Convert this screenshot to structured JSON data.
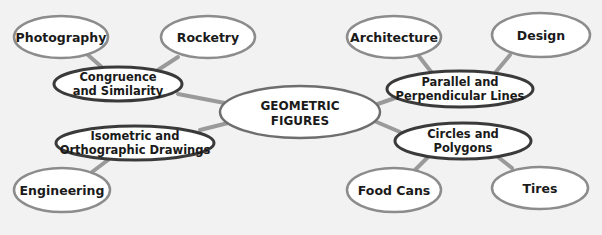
{
  "diagram": {
    "type": "concept-map",
    "colors": {
      "background": "#f2f2f2",
      "node_fill": "#ffffff",
      "leaf_stroke": "#8c8c8c",
      "mid_stroke": "#3a3a3a",
      "center_stroke": "#6e6e6e",
      "connector": "#9a9a9a",
      "text": "#1a1a1a"
    },
    "center": {
      "id": "geometric-figures",
      "lines": [
        "GEOMETRIC",
        "FIGURES"
      ]
    },
    "branches": [
      {
        "id": "congruence-similarity",
        "lines": [
          "Congruence",
          "and Similarity"
        ],
        "children": [
          {
            "id": "photography",
            "lines": [
              "Photography"
            ]
          },
          {
            "id": "rocketry",
            "lines": [
              "Rocketry"
            ]
          }
        ]
      },
      {
        "id": "isometric-orthographic",
        "lines": [
          "Isometric and",
          "Orthographic Drawings"
        ],
        "children": [
          {
            "id": "engineering",
            "lines": [
              "Engineering"
            ]
          }
        ]
      },
      {
        "id": "parallel-perpendicular",
        "lines": [
          "Parallel and",
          "Perpendicular Lines"
        ],
        "children": [
          {
            "id": "architecture",
            "lines": [
              "Architecture"
            ]
          },
          {
            "id": "design",
            "lines": [
              "Design"
            ]
          }
        ]
      },
      {
        "id": "circles-polygons",
        "lines": [
          "Circles and",
          "Polygons"
        ],
        "children": [
          {
            "id": "food-cans",
            "lines": [
              "Food Cans"
            ]
          },
          {
            "id": "tires",
            "lines": [
              "Tires"
            ]
          }
        ]
      }
    ]
  },
  "nodes": {
    "center": {
      "line1": "GEOMETRIC",
      "line2": "FIGURES"
    },
    "congruence": {
      "line1": "Congruence",
      "line2": "and Similarity"
    },
    "isometric": {
      "line1": "Isometric and",
      "line2": "Orthographic Drawings"
    },
    "parallel": {
      "line1": "Parallel and",
      "line2": "Perpendicular Lines"
    },
    "circles": {
      "line1": "Circles and",
      "line2": "Polygons"
    },
    "photography": {
      "label": "Photography"
    },
    "rocketry": {
      "label": "Rocketry"
    },
    "engineering": {
      "label": "Engineering"
    },
    "architecture": {
      "label": "Architecture"
    },
    "design": {
      "label": "Design"
    },
    "food_cans": {
      "label": "Food Cans"
    },
    "tires": {
      "label": "Tires"
    }
  }
}
